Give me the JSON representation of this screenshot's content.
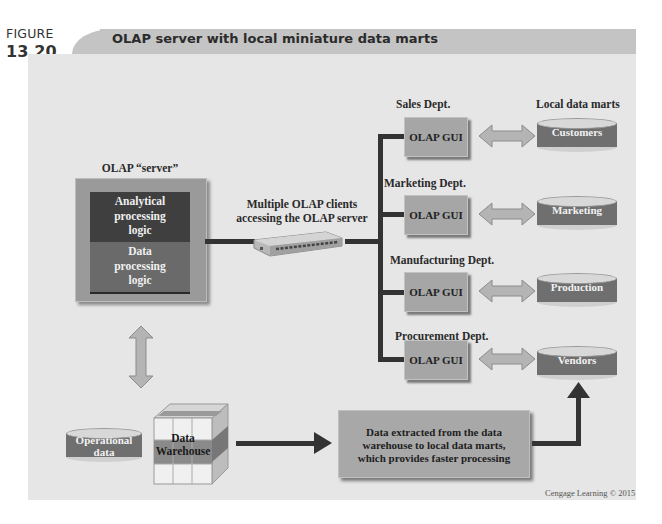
{
  "figure": {
    "label_word": "FIGURE",
    "label_number": "13.20",
    "title": "OLAP server with local miniature data marts",
    "credit": "Cengage Learning © 2015"
  },
  "server": {
    "heading": "OLAP  “server”",
    "top_block": [
      "Analytical",
      "processing",
      "logic"
    ],
    "bottom_block": [
      "Data",
      "processing",
      "logic"
    ]
  },
  "network": {
    "label": [
      "Multiple OLAP clients",
      "accessing the OLAP server"
    ],
    "device": "network-switch"
  },
  "marts_heading": "Local data marts",
  "departments": [
    {
      "name": "Sales Dept.",
      "client": "OLAP GUI",
      "mart": "Customers"
    },
    {
      "name": "Marketing Dept.",
      "client": "OLAP GUI",
      "mart": "Marketing"
    },
    {
      "name": "Manufacturing Dept.",
      "client": "OLAP GUI",
      "mart": "Production"
    },
    {
      "name": "Procurement Dept.",
      "client": "OLAP GUI",
      "mart": "Vendors"
    }
  ],
  "sources": {
    "operational": [
      "Operational",
      "data"
    ],
    "warehouse": [
      "Data",
      "Warehouse"
    ]
  },
  "extract_box": [
    "Data extracted from the data",
    "warehouse to local data marts,",
    "which provides faster processing"
  ],
  "colors": {
    "panel": "#e6e6e6",
    "title_bar": "#c4c4c4",
    "dark_block": "#3f3f3f",
    "mid_block": "#6a6a6a",
    "gui_box": "#a6a6a6",
    "connector": "#333333"
  }
}
